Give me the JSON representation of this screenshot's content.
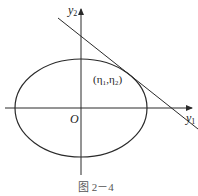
{
  "diagram": {
    "y_axis_label": "y",
    "y_axis_sub": "2",
    "x_axis_label": "y",
    "x_axis_sub": "1",
    "origin_label": "O",
    "point_label": "(η₁,η₂)",
    "caption": "图 2－4",
    "stroke_color": "#2a2a2a",
    "ellipse": {
      "cx": 81,
      "cy": 108,
      "rx": 66,
      "ry": 49
    },
    "tangent_line": {
      "x1": 58,
      "y1": 18,
      "x2": 198,
      "y2": 129
    },
    "x_axis": {
      "x1": 5,
      "y1": 108,
      "x2": 192,
      "y2": 108
    },
    "y_axis": {
      "x1": 81,
      "y1": 175,
      "x2": 81,
      "y2": 9
    }
  }
}
